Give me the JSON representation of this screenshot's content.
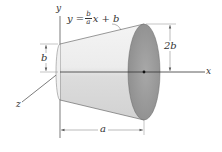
{
  "diagram": {
    "type": "3d-solid-of-revolution",
    "axes": {
      "x_label": "x",
      "y_label": "y",
      "z_label": "z"
    },
    "equation": {
      "lhs": "y =",
      "frac_num": "b",
      "frac_den": "a",
      "rhs": "x + b"
    },
    "dimensions": {
      "left_radius": "b",
      "right_radius": "2b",
      "length": "a"
    },
    "colors": {
      "solid_light": "#ececec",
      "solid_shade": "#d8d8d8",
      "end_face": "#9a9a9a",
      "line": "#444444",
      "dim_line": "#777777"
    }
  }
}
